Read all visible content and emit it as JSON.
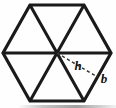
{
  "figure": {
    "caption": "",
    "background_color": "#fefefe",
    "stroke_color": "#1a1a1a",
    "dash_color": "#3a3a3a",
    "labels": {
      "apothem": "h",
      "base": "b"
    },
    "shape": {
      "name": "regular-hexagon",
      "sides": 6,
      "triangles": 6,
      "vertices": [
        [
          30,
          5
        ],
        [
          84,
          5
        ],
        [
          111,
          53
        ],
        [
          84,
          101
        ],
        [
          30,
          101
        ],
        [
          3,
          53
        ]
      ],
      "center": [
        57,
        53
      ],
      "diagonals": [
        [
          [
            30,
            5
          ],
          [
            84,
            101
          ]
        ],
        [
          [
            84,
            5
          ],
          [
            30,
            101
          ]
        ],
        [
          [
            3,
            53
          ],
          [
            111,
            53
          ]
        ]
      ],
      "apothem_segment": [
        [
          57,
          53
        ],
        [
          97.5,
          77
        ]
      ]
    },
    "label_positions": {
      "apothem": [
        78,
        70
      ],
      "base": [
        100,
        83
      ]
    }
  }
}
